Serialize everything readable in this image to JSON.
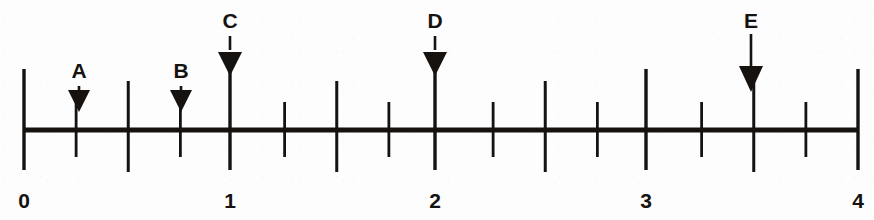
{
  "figure": {
    "ink_color": "#15120f",
    "background_color": "#fdfdfd"
  },
  "chart_data": {
    "type": "number-line",
    "title": "",
    "xlabel": "",
    "ylabel": "",
    "xlim": [
      0,
      4
    ],
    "grid": false,
    "legend": "none",
    "axis": {
      "start_value": 0,
      "end_value": 4,
      "pixel_start": 24,
      "pixel_end": 858,
      "baseline_y": 130
    },
    "major_ticks": {
      "values": [
        0,
        1,
        2,
        3,
        4
      ],
      "labels": [
        "0",
        "1",
        "2",
        "3",
        "4"
      ],
      "pixels": [
        24,
        230,
        435,
        646,
        858
      ],
      "top_y": 69,
      "bottom_y": 170
    },
    "medium_ticks": {
      "values": [
        0.5,
        1.5,
        2.5,
        3.5
      ],
      "top_y": 81,
      "bottom_y": 172
    },
    "minor_ticks": {
      "values": [
        0.25,
        0.75,
        1.25,
        1.75,
        2.25,
        2.75,
        3.25,
        3.75
      ],
      "top_y": 102,
      "bottom_y": 157
    },
    "markers": [
      {
        "label": "A",
        "value": 0.25,
        "pixel_x": 79,
        "label_y": 78,
        "stem_top": 86,
        "stem_bottom": 96,
        "head_top": 90,
        "head_bottom": 112,
        "head_half_width": 11
      },
      {
        "label": "B",
        "value": 0.75,
        "pixel_x": 181,
        "label_y": 78,
        "stem_top": 86,
        "stem_bottom": 96,
        "head_top": 90,
        "head_bottom": 112,
        "head_half_width": 11
      },
      {
        "label": "C",
        "value": 1.0,
        "pixel_x": 230,
        "label_y": 28,
        "stem_top": 36,
        "stem_bottom": 50,
        "head_top": 52,
        "head_bottom": 76,
        "head_half_width": 12
      },
      {
        "label": "D",
        "value": 2.0,
        "pixel_x": 435,
        "label_y": 28,
        "stem_top": 36,
        "stem_bottom": 50,
        "head_top": 52,
        "head_bottom": 76,
        "head_half_width": 12
      },
      {
        "label": "E",
        "value": 3.5,
        "pixel_x": 751,
        "label_y": 28,
        "stem_top": 34,
        "stem_bottom": 68,
        "head_top": 66,
        "head_bottom": 92,
        "head_half_width": 12
      }
    ],
    "annotations": []
  }
}
